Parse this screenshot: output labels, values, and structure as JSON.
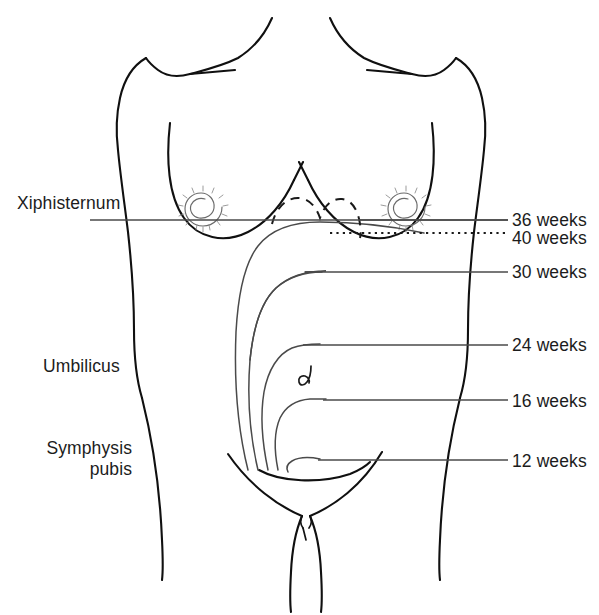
{
  "figure": {
    "type": "anatomical-diagram",
    "background_color": "#ffffff",
    "outline_color": "#101010",
    "curve_color": "#4a4a4a",
    "label_color": "#1c1c1c"
  },
  "landmarks": [
    {
      "id": "xiphisternum",
      "label": "Xiphisternum",
      "x": 17,
      "y": 193,
      "two_line": false,
      "rule": {
        "x1": 90,
        "y1": 220,
        "x2": 300,
        "y2": 220
      }
    },
    {
      "id": "umbilicus",
      "label": "Umbilicus",
      "x": 43,
      "y": 356,
      "two_line": false,
      "rule": null
    },
    {
      "id": "symphysis-pubis",
      "label": "Symphysis\npubis",
      "label_line_1": "Symphysis",
      "label_line_2": "pubis",
      "x": 32,
      "y": 438,
      "two_line": true,
      "rule": null
    }
  ],
  "fundal_heights": [
    {
      "id": "36-weeks",
      "weeks": 36,
      "label": "36 weeks",
      "style": "dashed",
      "leader": {
        "x1": 490,
        "y1": 220,
        "x2": 508,
        "y2": 220
      },
      "label_x": 512,
      "label_y": 210
    },
    {
      "id": "40-weeks",
      "weeks": 40,
      "label": "40 weeks",
      "style": "dotted",
      "leader": {
        "x1": 420,
        "y1": 233,
        "x2": 508,
        "y2": 233
      },
      "label_x": 512,
      "label_y": 228
    },
    {
      "id": "30-weeks",
      "weeks": 30,
      "label": "30 weeks",
      "style": "solid",
      "leader": {
        "x1": 305,
        "y1": 272,
        "x2": 508,
        "y2": 272
      },
      "label_x": 512,
      "label_y": 262
    },
    {
      "id": "24-weeks",
      "weeks": 24,
      "label": "24 weeks",
      "style": "solid",
      "leader": {
        "x1": 303,
        "y1": 345,
        "x2": 508,
        "y2": 345
      },
      "label_x": 512,
      "label_y": 335
    },
    {
      "id": "16-weeks",
      "weeks": 16,
      "label": "16 weeks",
      "style": "solid",
      "leader": {
        "x1": 323,
        "y1": 400,
        "x2": 508,
        "y2": 400
      },
      "label_x": 512,
      "label_y": 391
    },
    {
      "id": "12-weeks",
      "weeks": 12,
      "label": "12 weeks",
      "style": "solid",
      "leader": {
        "x1": 318,
        "y1": 460,
        "x2": 508,
        "y2": 460
      },
      "label_x": 512,
      "label_y": 451
    }
  ],
  "anatomy": {
    "left_nipple": {
      "cx": 205,
      "cy": 205
    },
    "right_nipple": {
      "cx": 408,
      "cy": 205
    },
    "navel": {
      "cx": 307,
      "cy": 375
    }
  }
}
